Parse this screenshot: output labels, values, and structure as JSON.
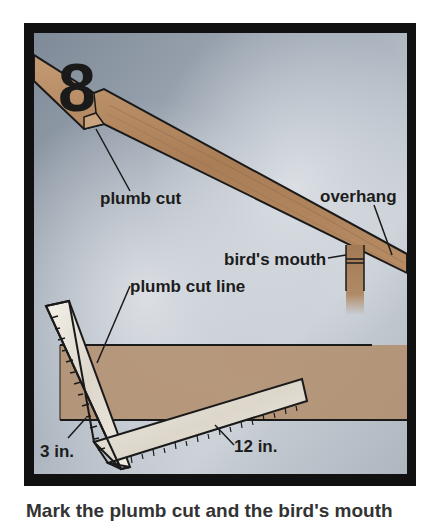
{
  "figure": {
    "step_number": "8",
    "labels": {
      "plumb_cut": "plumb cut",
      "overhang": "overhang",
      "birds_mouth": "bird's mouth",
      "plumb_cut_line": "plumb cut line",
      "short_leg": "3 in.",
      "long_leg": "12 in."
    },
    "colors": {
      "frame": "#111111",
      "sky": "#8f9aa6",
      "wood": "#b48a63",
      "square": "#f1ece2"
    }
  },
  "caption": {
    "text": "Mark the plumb cut and the bird's mouth"
  }
}
